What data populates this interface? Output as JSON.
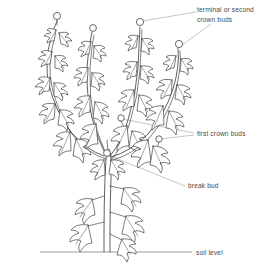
{
  "diagram": {
    "background_color": "#ffffff",
    "line_color": "#2b2b2b",
    "leader_line_color": "#8d8d8d",
    "text_color": "#4a4a4a"
  },
  "labels": {
    "terminal_buds": {
      "line1": "terminal or second",
      "line2": "crown buds"
    },
    "first_crown_buds": "first crown buds",
    "break_bud": "break bud",
    "soil_level": "soil level"
  }
}
